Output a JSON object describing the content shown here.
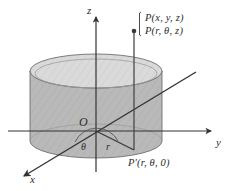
{
  "figure": {
    "axes": {
      "z_label": "z",
      "y_label": "y",
      "x_label": "x",
      "origin_label": "O"
    },
    "labels": {
      "point_cartesian": "P(x, y, z)",
      "point_cylindrical": "P(r, θ, z)",
      "point_projection": "P′(r, θ, 0)",
      "angle": "θ",
      "radius": "r"
    },
    "colors": {
      "background": "#ffffff",
      "stroke": "#3a3a3a",
      "cylinder_side": "#b9b9b9",
      "cylinder_top": "#dadada",
      "cylinder_top_edge": "#8f8f8f",
      "text": "#2b2b2b",
      "axis": "#333333"
    },
    "geometry": {
      "origin": [
        96,
        131
      ],
      "cylinder_center_x": 96,
      "cylinder_radius_x": 66,
      "cylinder_radius_y": 17,
      "cylinder_top_y": 71,
      "cylinder_bottom_y": 141,
      "point_P": [
        134,
        31
      ],
      "point_P_prime": [
        134,
        150
      ],
      "z_axis_top": [
        96,
        16
      ],
      "y_axis_right": [
        213,
        131
      ],
      "x_axis_front": [
        22,
        178
      ]
    }
  }
}
